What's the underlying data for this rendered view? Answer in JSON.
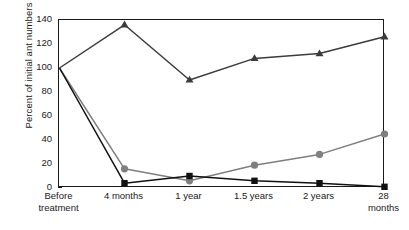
{
  "chart_data": {
    "type": "line",
    "title": "",
    "xlabel": "",
    "ylabel": "Percent of initial ant numbers",
    "categories": [
      "Before\ntreatment",
      "4 months",
      "1 year",
      "1.5 years",
      "2 years",
      "28 months"
    ],
    "category_labels_flat": [
      "Before treatment",
      "4 months",
      "1 year",
      "1.5 years",
      "2 years",
      "28 months"
    ],
    "ylim": [
      0,
      140
    ],
    "yticks": [
      0,
      20,
      40,
      60,
      80,
      100,
      120,
      140
    ],
    "ytick_labels": [
      "0",
      "20",
      "40",
      "60",
      "80",
      "100",
      "120",
      "140"
    ],
    "grid": false,
    "legend": "none",
    "series": [
      {
        "name": "triangle-series",
        "marker": "triangle",
        "color": "#3c3c3c",
        "values": [
          100,
          136,
          90,
          108,
          112,
          126
        ]
      },
      {
        "name": "circle-series",
        "marker": "circle",
        "color": "#7f7f7f",
        "values": [
          100,
          16,
          6,
          19,
          28,
          45
        ]
      },
      {
        "name": "square-series",
        "marker": "square",
        "color": "#111111",
        "values": [
          100,
          4,
          10,
          6,
          4,
          1
        ]
      }
    ]
  },
  "colors": {
    "axis": "#1a1a1a",
    "background": "#ffffff",
    "triangle": "#3c3c3c",
    "circle": "#7f7f7f",
    "square": "#111111"
  }
}
